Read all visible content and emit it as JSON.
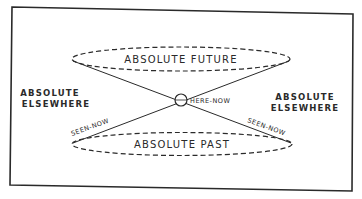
{
  "diagram": {
    "regions": {
      "future": "ABSOLUTE FUTURE",
      "past": "ABSOLUTE PAST",
      "elsewhere_left_line1": "ABSOLUTE",
      "elsewhere_left_line2": "ELSEWHERE",
      "elsewhere_right_line1": "ABSOLUTE",
      "elsewhere_right_line2": "ELSEWHERE"
    },
    "points": {
      "origin": "HERE-NOW",
      "seen_left": "SEEN-NOW",
      "seen_right": "SEEN-NOW"
    },
    "colors": {
      "ink": "#2a2a2a",
      "background": "#ffffff"
    }
  }
}
